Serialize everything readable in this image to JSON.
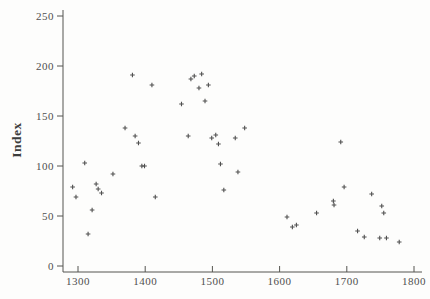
{
  "chart_data": {
    "type": "scatter",
    "title": "",
    "xlabel": "",
    "ylabel": "Index",
    "x_ticks": [
      1300,
      1400,
      1500,
      1600,
      1700,
      1800
    ],
    "y_ticks": [
      0,
      50,
      100,
      150,
      200,
      250
    ],
    "xlim": [
      1278,
      1812
    ],
    "ylim": [
      0,
      260
    ],
    "grid": false,
    "legend": "none",
    "marker": "plus",
    "colors": {
      "background": "#fdfdfc",
      "axis": "#555550",
      "tick_text": "#4f4f4f",
      "marker": "#3d3d3d"
    },
    "points": [
      {
        "x": 1292,
        "y": 79
      },
      {
        "x": 1297,
        "y": 69
      },
      {
        "x": 1310,
        "y": 103
      },
      {
        "x": 1315,
        "y": 32
      },
      {
        "x": 1321,
        "y": 56
      },
      {
        "x": 1327,
        "y": 82
      },
      {
        "x": 1330,
        "y": 77
      },
      {
        "x": 1335,
        "y": 73
      },
      {
        "x": 1352,
        "y": 92
      },
      {
        "x": 1370,
        "y": 138
      },
      {
        "x": 1381,
        "y": 191
      },
      {
        "x": 1385,
        "y": 130
      },
      {
        "x": 1390,
        "y": 123
      },
      {
        "x": 1395,
        "y": 100
      },
      {
        "x": 1399,
        "y": 100
      },
      {
        "x": 1410,
        "y": 181
      },
      {
        "x": 1415,
        "y": 69
      },
      {
        "x": 1454,
        "y": 162
      },
      {
        "x": 1464,
        "y": 130
      },
      {
        "x": 1468,
        "y": 187
      },
      {
        "x": 1473,
        "y": 190
      },
      {
        "x": 1480,
        "y": 178
      },
      {
        "x": 1484,
        "y": 192
      },
      {
        "x": 1489,
        "y": 165
      },
      {
        "x": 1494,
        "y": 181
      },
      {
        "x": 1499,
        "y": 128
      },
      {
        "x": 1505,
        "y": 131
      },
      {
        "x": 1509,
        "y": 122
      },
      {
        "x": 1512,
        "y": 102
      },
      {
        "x": 1517,
        "y": 76
      },
      {
        "x": 1534,
        "y": 128
      },
      {
        "x": 1538,
        "y": 94
      },
      {
        "x": 1548,
        "y": 138
      },
      {
        "x": 1611,
        "y": 49
      },
      {
        "x": 1619,
        "y": 39
      },
      {
        "x": 1625,
        "y": 41
      },
      {
        "x": 1655,
        "y": 53
      },
      {
        "x": 1680,
        "y": 65
      },
      {
        "x": 1681,
        "y": 61
      },
      {
        "x": 1691,
        "y": 124
      },
      {
        "x": 1696,
        "y": 79
      },
      {
        "x": 1716,
        "y": 35
      },
      {
        "x": 1726,
        "y": 29
      },
      {
        "x": 1737,
        "y": 72
      },
      {
        "x": 1749,
        "y": 28
      },
      {
        "x": 1752,
        "y": 60
      },
      {
        "x": 1755,
        "y": 53
      },
      {
        "x": 1759,
        "y": 28
      },
      {
        "x": 1778,
        "y": 24
      }
    ]
  }
}
